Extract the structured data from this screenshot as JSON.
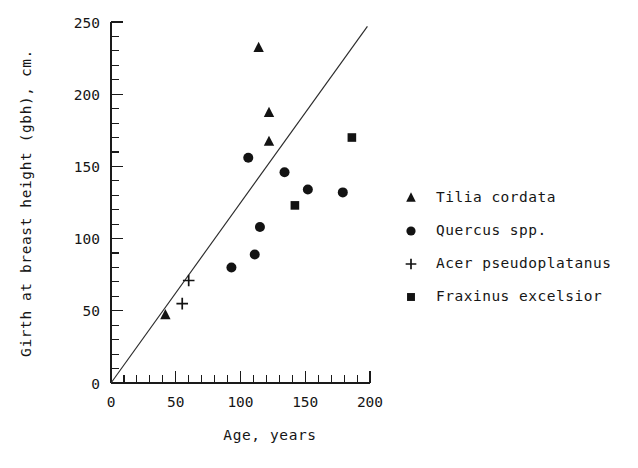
{
  "chart_data": {
    "type": "scatter",
    "title": "",
    "xlabel": "Age, years",
    "ylabel": "Girth at breast height (gbh), cm.",
    "xlim": [
      0,
      200
    ],
    "ylim": [
      0,
      250
    ],
    "xticks": [
      0,
      50,
      100,
      150,
      200
    ],
    "yticks": [
      0,
      50,
      100,
      150,
      200,
      250
    ],
    "xtick_labels": [
      "0",
      "50",
      "100",
      "150",
      "200"
    ],
    "ytick_labels": [
      "0",
      "50",
      "100",
      "150",
      "200",
      "250"
    ],
    "x_minor_step": 10,
    "y_minor_step": 10,
    "grid": false,
    "legend_position": "right",
    "reference_line": {
      "label": "1:1.25 reference line",
      "x": [
        0,
        198
      ],
      "y": [
        0,
        247
      ]
    },
    "series": [
      {
        "name": "Tilia cordata",
        "marker": "triangle",
        "color": "#131313",
        "points": [
          {
            "x": 114,
            "y": 232
          },
          {
            "x": 122,
            "y": 187
          },
          {
            "x": 122,
            "y": 167
          },
          {
            "x": 42,
            "y": 47
          }
        ]
      },
      {
        "name": "Quercus spp.",
        "marker": "circle",
        "color": "#131313",
        "points": [
          {
            "x": 106,
            "y": 156
          },
          {
            "x": 134,
            "y": 146
          },
          {
            "x": 152,
            "y": 134
          },
          {
            "x": 179,
            "y": 132
          },
          {
            "x": 115,
            "y": 108
          },
          {
            "x": 111,
            "y": 89
          },
          {
            "x": 93,
            "y": 80
          }
        ]
      },
      {
        "name": "Acer pseudoplatanus",
        "marker": "plus",
        "color": "#131313",
        "points": [
          {
            "x": 60,
            "y": 71
          },
          {
            "x": 55,
            "y": 55
          }
        ]
      },
      {
        "name": "Fraxinus excelsior",
        "marker": "square",
        "color": "#131313",
        "points": [
          {
            "x": 186,
            "y": 170
          },
          {
            "x": 142,
            "y": 123
          }
        ]
      }
    ]
  },
  "legend": {
    "entries": [
      {
        "label": "Tilia cordata",
        "marker": "triangle-marker"
      },
      {
        "label": "Quercus spp.",
        "marker": "circle-marker"
      },
      {
        "label": "Acer pseudoplatanus",
        "marker": "plus-marker"
      },
      {
        "label": "Fraxinus excelsior",
        "marker": "square-marker"
      }
    ]
  },
  "axes": {
    "x_title": "Age, years",
    "y_title": "Girth at breast height (gbh), cm.",
    "x_labels": [
      "0",
      "50",
      "100",
      "150",
      "200"
    ],
    "y_labels": [
      "0",
      "50",
      "100",
      "150",
      "200",
      "250"
    ]
  }
}
